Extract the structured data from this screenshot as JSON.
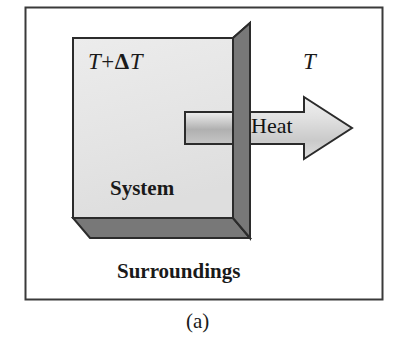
{
  "figure": {
    "caption": "(a)",
    "frame": {
      "border_color": "#3a3a3a",
      "fill_color": "#ffffff"
    },
    "box": {
      "front_face_color": "#e6e6e6",
      "side_face_color": "#787878",
      "outline_color": "#2b2b2b",
      "system_label": "System"
    },
    "labels": {
      "hot_temperature": "T + ΔT",
      "hot_temperature_base": "T",
      "hot_temperature_operator": "+",
      "hot_temperature_delta": "Δ",
      "hot_temperature_delta_base": "T",
      "cold_temperature": "T",
      "surroundings": "Surroundings"
    },
    "arrow": {
      "label": "Heat",
      "direction": "right",
      "shaft_color_light": "#e2e2e2",
      "shaft_color_mid": "#b4b4b4",
      "head_color": "#d9d9d9",
      "outline_color": "#2b2b2b"
    }
  }
}
